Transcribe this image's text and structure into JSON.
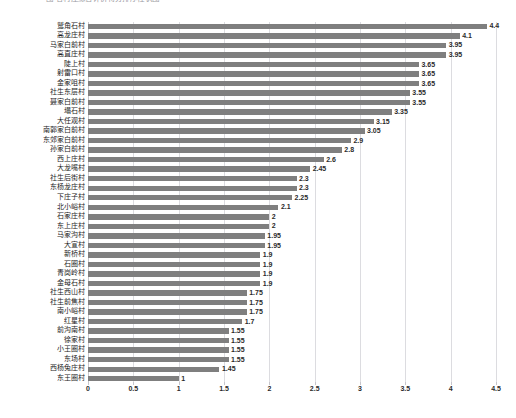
{
  "chart": {
    "title": "图 各村庄综合评价得分排序柱状图",
    "type": "bar"
  },
  "axis": {
    "x_ticks": [
      "0",
      "0.5",
      "1",
      "1.5",
      "2",
      "2.5",
      "3",
      "3.5",
      "4",
      "4.5"
    ],
    "x_min": 0,
    "x_max": 4.5
  },
  "style": {
    "bar_color": "#7f7f7f",
    "gridline_color": "#dcdce0",
    "label_color": "#1d1d1d",
    "background": "#ffffff"
  },
  "chart_data": {
    "type": "bar",
    "orientation": "horizontal",
    "title": "图 各村庄综合评价得分排序柱状图",
    "xlabel": "",
    "ylabel": "",
    "xlim": [
      0,
      4.5
    ],
    "grid": true,
    "legend": "none",
    "categories": [
      "鹫角石村",
      "高龙庄村",
      "马家白前村",
      "高直庄村",
      "陡上村",
      "射雷口村",
      "金家咀村",
      "社生东层村",
      "聂家白前村",
      "塌石村",
      "大任观村",
      "南郭家白前村",
      "东郊家白前村",
      "孙家白前村",
      "西上庄村",
      "大龙嘴村",
      "社生后街村",
      "东杨龙庄村",
      "下庄子村",
      "北小峪村",
      "石家庄村",
      "东上庄村",
      "马家沟村",
      "大宣村",
      "新桥村",
      "石圈村",
      "青岗岭村",
      "金母石村",
      "社生西山村",
      "社生前焦村",
      "南小峪村",
      "红星村",
      "前沟南村",
      "徐家村",
      "小王圈村",
      "东场村",
      "西杨兔庄村",
      "东王圈村"
    ],
    "values": [
      4.4,
      4.1,
      3.95,
      3.95,
      3.65,
      3.65,
      3.65,
      3.55,
      3.55,
      3.35,
      3.15,
      3.05,
      2.9,
      2.8,
      2.6,
      2.45,
      2.3,
      2.3,
      2.25,
      2.1,
      2,
      2,
      1.95,
      1.95,
      1.9,
      1.9,
      1.9,
      1.9,
      1.75,
      1.75,
      1.75,
      1.7,
      1.55,
      1.55,
      1.55,
      1.55,
      1.45,
      1
    ],
    "value_labels": [
      "4.4",
      "4.1",
      "3.95",
      "3.95",
      "3.65",
      "3.65",
      "3.65",
      "3.55",
      "3.55",
      "3.35",
      "3.15",
      "3.05",
      "2.9",
      "2.8",
      "2.6",
      "2.45",
      "2.3",
      "2.3",
      "2.25",
      "2.1",
      "2",
      "2",
      "1.95",
      "1.95",
      "1.9",
      "1.9",
      "1.9",
      "1.9",
      "1.75",
      "1.75",
      "1.75",
      "1.7",
      "1.55",
      "1.55",
      "1.55",
      "1.55",
      "1.45",
      "1"
    ]
  }
}
